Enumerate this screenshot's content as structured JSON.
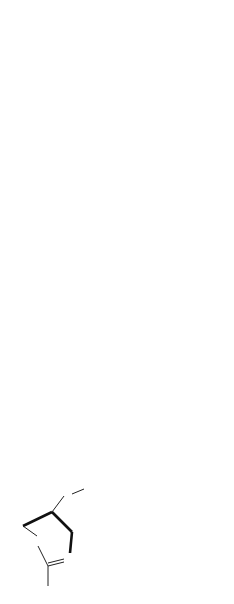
{
  "rows": [
    {
      "reactant": {
        "substituents": {
          "top": "Ph",
          "ring_o": "O",
          "ring_n": "N",
          "side_chain": "CH2",
          "side_chain_end": "OMe",
          "c2_group": "X-CH2"
        }
      },
      "reagents": [
        "1)  LDA",
        "2)  RX"
      ],
      "product": {
        "formula": "R-CHX-COOH",
        "yield": "(50-65)",
        "description_lines": [
          "2-chloro- or 2-methoxy-",
          "carboxylic acid"
        ]
      },
      "ee": "low"
    },
    {
      "reactant": {
        "substituents": {
          "top": "Ph",
          "ring_o": "O",
          "ring_n": "N",
          "side_chain": "CH2",
          "side_chain_end": "OMe",
          "c2_group": "Me-S"
        }
      },
      "reagents": [
        "1)  LDA",
        "2)  R-CO-R'"
      ],
      "product": {
        "ring_atom": "S",
        "sub_r": "R",
        "sub_r2": "R'",
        "name": "Thiirane",
        "yield": "(19-32)"
      }
    }
  ]
}
